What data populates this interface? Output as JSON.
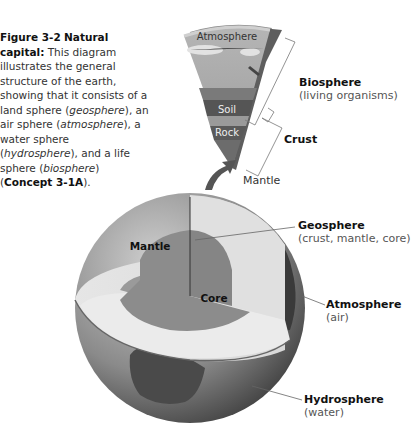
{
  "caption": {
    "figure_number": "Figure 3-2",
    "figure_title": "Natural capital:",
    "text_1": "This diagram illustrates the general structure of the earth, showing that it consists of a land sphere (",
    "geosphere": "geosphere",
    "text_2": "), an air sphere (",
    "atmosphere": "atmosphere",
    "text_3": "), a water sphere (",
    "hydrosphere": "hydrosphere",
    "text_4": "), and a life sphere (",
    "biosphere": "biosphere",
    "text_5": ") (",
    "concept": "Concept 3-1A",
    "text_6": ")."
  },
  "wedge_labels": {
    "atmosphere": "Atmosphere",
    "soil": "Soil",
    "rock": "Rock"
  },
  "callouts": {
    "biosphere": {
      "title": "Biosphere",
      "sub": "(living organisms)"
    },
    "crust": {
      "title": "Crust"
    },
    "mantle_wedge": {
      "title": "Mantle"
    },
    "geosphere": {
      "title": "Geosphere",
      "sub": "(crust, mantle, core)"
    },
    "atmosphere": {
      "title": "Atmosphere",
      "sub": "(air)"
    },
    "hydrosphere": {
      "title": "Hydrosphere",
      "sub": "(water)"
    }
  },
  "globe_labels": {
    "mantle": "Mantle",
    "core": "Core"
  }
}
